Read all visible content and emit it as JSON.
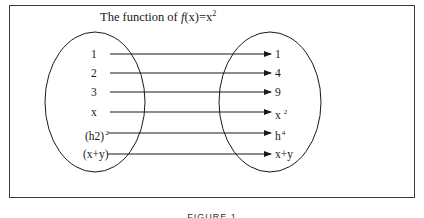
{
  "figure": {
    "title_prefix": "The function of ",
    "title_fn": "f",
    "title_mid": "(x)=x",
    "title_exp": "2",
    "caption": "FIGURE 1"
  },
  "domain_set": {
    "items": [
      {
        "base": "1",
        "exp": ""
      },
      {
        "base": "2",
        "exp": ""
      },
      {
        "base": "3",
        "exp": ""
      },
      {
        "base": "x",
        "exp": ""
      },
      {
        "base": "(h2)",
        "exp": "2"
      },
      {
        "base": "(x+y)",
        "exp": ""
      }
    ]
  },
  "codomain_set": {
    "items": [
      {
        "base": "1",
        "exp": ""
      },
      {
        "base": "4",
        "exp": ""
      },
      {
        "base": "9",
        "exp": ""
      },
      {
        "base": "x",
        "exp": "2"
      },
      {
        "base": "h",
        "exp": "4"
      },
      {
        "base": "x+y",
        "exp": ""
      }
    ]
  },
  "mappings": [
    {
      "from": "1",
      "to": "1"
    },
    {
      "from": "2",
      "to": "4"
    },
    {
      "from": "3",
      "to": "9"
    },
    {
      "from": "x",
      "to": "x^2"
    },
    {
      "from": "(h2)^2",
      "to": "h^4"
    },
    {
      "from": "(x+y)",
      "to": "x+y"
    }
  ],
  "colors": {
    "stroke": "#1a1a1a",
    "frame": "#3a3a3a",
    "background": "#ffffff"
  }
}
